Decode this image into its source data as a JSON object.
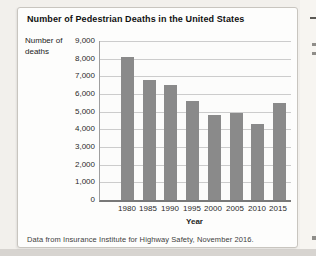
{
  "figure": {
    "source_note": "Data from Insurance Institute for Highway Safety, November 2016."
  },
  "chart_data": {
    "type": "bar",
    "title": "Number of Pedestrian Deaths in the United States",
    "ylabel": "Number of deaths",
    "xlabel": "Year",
    "categories": [
      "1980",
      "1985",
      "1990",
      "1995",
      "2000",
      "2005",
      "2010",
      "2015"
    ],
    "values": [
      8100,
      6800,
      6500,
      5600,
      4800,
      4900,
      4300,
      5500
    ],
    "ylim": [
      0,
      9000
    ],
    "ytick_step": 1000,
    "ytick_labels": [
      "0",
      "1,000",
      "2,000",
      "3,000",
      "4,000",
      "5,000",
      "6,000",
      "7,000",
      "8,000",
      "9,000"
    ],
    "grid": true,
    "legend": false,
    "bar_color": "#8a8a8a",
    "gridline_color": "#cccccc"
  }
}
